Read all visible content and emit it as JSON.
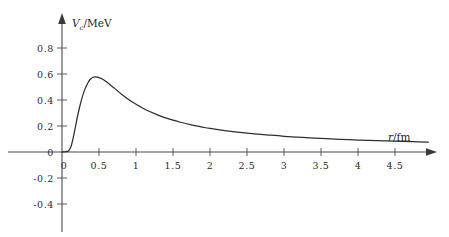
{
  "chart_data": {
    "type": "line",
    "title": "",
    "subtitle": "",
    "xlabel": "r/fm",
    "ylabel": "V_c/MeV",
    "ylabel_symbol": "V",
    "ylabel_subscript": "c",
    "ylabel_unit": "/MeV",
    "xlabel_symbol": "r",
    "xlabel_unit": "/fm",
    "grid": false,
    "legend": "none",
    "xlim": [
      0,
      4.95
    ],
    "ylim": [
      -0.48,
      0.92
    ],
    "xticks": [
      0,
      0.5,
      1,
      1.5,
      2,
      2.5,
      3,
      3.5,
      4,
      4.5
    ],
    "xticklabels": [
      "0",
      "0.5",
      "1",
      "1.5",
      "2",
      "2.5",
      "3",
      "3.5",
      "4",
      "4.5"
    ],
    "yticks": [
      -0.4,
      -0.2,
      0,
      0.2,
      0.4,
      0.6,
      0.8
    ],
    "yticklabels": [
      "-0.4",
      "-0.2",
      "0",
      "0.2",
      "0.4",
      "0.6",
      "0.8"
    ],
    "series": [
      {
        "name": "Coulomb potential",
        "x": [
          0.0,
          0.05,
          0.09,
          0.12,
          0.15,
          0.18,
          0.21,
          0.24,
          0.27,
          0.3,
          0.33,
          0.36,
          0.39,
          0.42,
          0.45,
          0.48,
          0.52,
          0.56,
          0.6,
          0.65,
          0.7,
          0.75,
          0.8,
          0.9,
          1.0,
          1.1,
          1.2,
          1.3,
          1.4,
          1.5,
          1.6,
          1.75,
          1.9,
          2.0,
          2.2,
          2.4,
          2.6,
          2.8,
          3.0,
          3.25,
          3.5,
          3.75,
          4.0,
          4.25,
          4.5,
          4.75,
          4.95
        ],
        "y": [
          0.0,
          0.002,
          0.01,
          0.04,
          0.105,
          0.19,
          0.275,
          0.35,
          0.415,
          0.468,
          0.51,
          0.542,
          0.563,
          0.575,
          0.578,
          0.576,
          0.568,
          0.556,
          0.541,
          0.518,
          0.494,
          0.47,
          0.447,
          0.404,
          0.367,
          0.335,
          0.308,
          0.284,
          0.263,
          0.245,
          0.229,
          0.208,
          0.191,
          0.181,
          0.165,
          0.151,
          0.14,
          0.13,
          0.121,
          0.112,
          0.104,
          0.098,
          0.092,
          0.087,
          0.083,
          0.079,
          0.076
        ]
      }
    ],
    "annotations": {
      "peak_x": 0.45,
      "peak_y": 0.58
    }
  },
  "axes": {
    "x_arrow": true,
    "y_arrow": true,
    "line_color": "#4a4a4a",
    "curve_color": "#2e2e2e"
  }
}
